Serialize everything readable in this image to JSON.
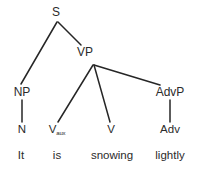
{
  "diagram": {
    "type": "syntax-tree",
    "sentence": "It is snowing lightly",
    "colors": {
      "background": "#ffffff",
      "text": "#2b2b2b",
      "edge": "#262626"
    },
    "nodes": [
      {
        "id": "S",
        "label": "S",
        "sub": "",
        "x": 56,
        "y": 12,
        "level": "root"
      },
      {
        "id": "NP",
        "label": "NP",
        "sub": "",
        "x": 22,
        "y": 92,
        "level": "phrase"
      },
      {
        "id": "VP",
        "label": "VP",
        "sub": "",
        "x": 85,
        "y": 52,
        "level": "phrase"
      },
      {
        "id": "AdvP",
        "label": "AdvP",
        "sub": "",
        "x": 170,
        "y": 92,
        "level": "phrase"
      },
      {
        "id": "N",
        "label": "N",
        "sub": "",
        "x": 22,
        "y": 130,
        "level": "word"
      },
      {
        "id": "Vaux",
        "label": "V",
        "sub": "aux",
        "x": 57,
        "y": 130,
        "level": "word"
      },
      {
        "id": "V",
        "label": "V",
        "sub": "",
        "x": 111,
        "y": 130,
        "level": "word"
      },
      {
        "id": "Adv",
        "label": "Adv",
        "sub": "",
        "x": 170,
        "y": 130,
        "level": "word"
      }
    ],
    "terminals": [
      {
        "id": "t-it",
        "label": "It",
        "x": 21,
        "y": 156
      },
      {
        "id": "t-is",
        "label": "is",
        "x": 57,
        "y": 156
      },
      {
        "id": "t-snowing",
        "label": "snowing",
        "x": 112,
        "y": 156
      },
      {
        "id": "t-lightly",
        "label": "lightly",
        "x": 170,
        "y": 156
      }
    ],
    "edges": [
      {
        "id": "s-np",
        "from": "S",
        "to": "NP",
        "x1": 57,
        "y1": 22,
        "x2": 21,
        "y2": 84
      },
      {
        "id": "s-vp",
        "from": "S",
        "to": "VP",
        "x1": 58,
        "y1": 22,
        "x2": 81,
        "y2": 45
      },
      {
        "id": "vp-vaux",
        "from": "VP",
        "to": "Vaux",
        "x1": 93,
        "y1": 65,
        "x2": 58,
        "y2": 122
      },
      {
        "id": "vp-v",
        "from": "VP",
        "to": "V",
        "x1": 94,
        "y1": 65,
        "x2": 110,
        "y2": 122
      },
      {
        "id": "vp-advp",
        "from": "VP",
        "to": "AdvP",
        "x1": 94,
        "y1": 65,
        "x2": 160,
        "y2": 85
      },
      {
        "id": "np-n",
        "from": "NP",
        "to": "N",
        "x1": 22,
        "y1": 100,
        "x2": 22,
        "y2": 122
      },
      {
        "id": "advp-adv",
        "from": "AdvP",
        "to": "Adv",
        "x1": 170,
        "y1": 100,
        "x2": 170,
        "y2": 122
      }
    ]
  }
}
